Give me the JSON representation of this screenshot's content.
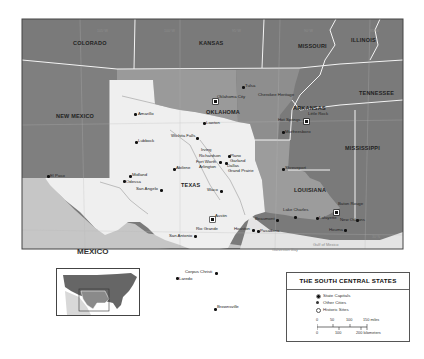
{
  "map": {
    "title": "THE SOUTH CENTRAL STATES",
    "colors": {
      "outer_states": "#7a7a7a",
      "oklahoma": "#9a9a9a",
      "arkansas": "#8e8e8e",
      "louisiana": "#9c9c9c",
      "texas": "#efefef",
      "mexico": "#c6c6c6",
      "gulf": "#e4e4e4",
      "borders": "#f4f4f4",
      "frame": "#444444"
    },
    "states": [
      {
        "name": "COLORADO"
      },
      {
        "name": "KANSAS"
      },
      {
        "name": "MISSOURI"
      },
      {
        "name": "ILLINOIS"
      },
      {
        "name": "TENNESSEE"
      },
      {
        "name": "NEW MEXICO"
      },
      {
        "name": "OKLAHOMA"
      },
      {
        "name": "ARKANSAS"
      },
      {
        "name": "MISSISSIPPI"
      },
      {
        "name": "TEXAS"
      },
      {
        "name": "LOUISIANA"
      }
    ],
    "country": "MEXICO",
    "water_bodies": [
      "Gulf of Mexico",
      "Galveston Bay"
    ],
    "cities": [
      {
        "name": "Tulsa",
        "type": "city"
      },
      {
        "name": "Oklahoma City",
        "type": "capital"
      },
      {
        "name": "Cherokee Heritage",
        "type": "historic"
      },
      {
        "name": "Lawton",
        "type": "city"
      },
      {
        "name": "Little Rock",
        "type": "capital"
      },
      {
        "name": "Hot Springs",
        "type": "historic"
      },
      {
        "name": "Murfreesboro",
        "type": "city"
      },
      {
        "name": "Amarillo",
        "type": "city"
      },
      {
        "name": "Lubbock",
        "type": "city"
      },
      {
        "name": "Wichita Falls",
        "type": "city"
      },
      {
        "name": "Irving",
        "type": "city"
      },
      {
        "name": "Richardson",
        "type": "city"
      },
      {
        "name": "Plano",
        "type": "city"
      },
      {
        "name": "Garland",
        "type": "city"
      },
      {
        "name": "Fort Worth",
        "type": "city"
      },
      {
        "name": "Arlington",
        "type": "city"
      },
      {
        "name": "Dallas",
        "type": "city"
      },
      {
        "name": "Grand Prairie",
        "type": "city"
      },
      {
        "name": "Abilene",
        "type": "city"
      },
      {
        "name": "Midland",
        "type": "city"
      },
      {
        "name": "Odessa",
        "type": "city"
      },
      {
        "name": "San Angelo",
        "type": "city"
      },
      {
        "name": "El Paso",
        "type": "city"
      },
      {
        "name": "Waco",
        "type": "city"
      },
      {
        "name": "Austin",
        "type": "capital"
      },
      {
        "name": "San Antonio",
        "type": "city"
      },
      {
        "name": "Rio Grande",
        "type": "historic"
      },
      {
        "name": "Houston",
        "type": "city"
      },
      {
        "name": "Pasadena",
        "type": "city"
      },
      {
        "name": "Beaumont",
        "type": "city"
      },
      {
        "name": "Lake Charles",
        "type": "city"
      },
      {
        "name": "Corpus Christi",
        "type": "city"
      },
      {
        "name": "Laredo",
        "type": "city"
      },
      {
        "name": "Brownsville",
        "type": "city"
      },
      {
        "name": "Shreveport",
        "type": "city"
      },
      {
        "name": "Baton Rouge",
        "type": "capital"
      },
      {
        "name": "Lafayette",
        "type": "city"
      },
      {
        "name": "New Orleans",
        "type": "city"
      },
      {
        "name": "Houma",
        "type": "city"
      }
    ],
    "gridlines": {
      "longitudes": [
        "105°W",
        "100°W",
        "95°W",
        "90°W",
        "85°W"
      ],
      "latitudes": [
        "40°N",
        "35°N",
        "30°N",
        "25°N"
      ]
    }
  },
  "legend": {
    "title": "THE SOUTH CENTRAL STATES",
    "items": [
      {
        "label": "State Capitals",
        "symbol": "capital"
      },
      {
        "label": "Other Cities",
        "symbol": "city"
      },
      {
        "label": "Historic Sites",
        "symbol": "historic"
      }
    ],
    "scale": {
      "miles_ticks": [
        "0",
        "50",
        "100",
        "150 miles"
      ],
      "km_ticks": [
        "0",
        "100",
        "200 kilometers"
      ]
    }
  },
  "inset": {
    "label": "United States locator"
  }
}
